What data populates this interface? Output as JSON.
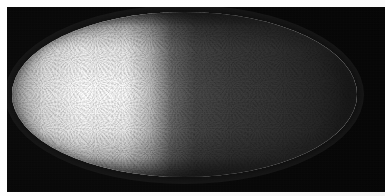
{
  "figure": {
    "kind": "fluorescence-micrograph",
    "specimen": "Drosophila embryo",
    "view": "sagittal surface, anterior left",
    "panel_background_color": "#050505",
    "page_background_color": "#ffffff",
    "signal_color": "#ffffff",
    "orientation": {
      "anterior": "left",
      "posterior": "right",
      "dorsal": "top",
      "ventral": "bottom"
    },
    "panel": {
      "x": 7,
      "y": 7,
      "width": 378,
      "height": 185
    },
    "embryo": {
      "x": 12,
      "y": 12,
      "width": 345,
      "height": 165,
      "shape": "ellipse"
    },
    "nuclei": {
      "pattern": "hexagonal cortical monolayer",
      "spacing_px": 4,
      "approximate_count": 4000
    },
    "gradient": {
      "description": "anterior-to-posterior nuclear intensity gradient",
      "peak_position_fraction": 0.22,
      "steep_falloff_fraction": 0.46,
      "posterior_floor_fraction": 0.08
    },
    "labels": {
      "title": "",
      "scale_bar": "",
      "annotation": ""
    }
  }
}
